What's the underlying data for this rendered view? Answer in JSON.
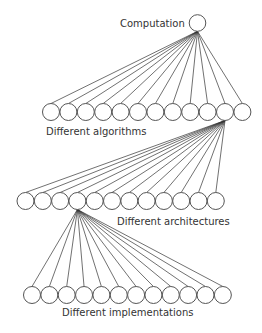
{
  "diagram": {
    "root": {
      "label": "Computation",
      "cx": 197.5,
      "cy": 23,
      "r": 8.3,
      "label_x": 120,
      "label_y": 27
    },
    "levels": [
      {
        "label": "Different algorithms",
        "label_x": 46,
        "label_y": 135,
        "node_count": 12,
        "first_cx": 51,
        "spacing": 17.4,
        "cy": 112,
        "r": 8.5,
        "parent": "root",
        "expanded_child_index": 10
      },
      {
        "label": "Different architectures",
        "label_x": 117,
        "label_y": 225,
        "node_count": 12,
        "first_cx": 25.5,
        "spacing": 17.3,
        "cy": 201,
        "r": 8.5,
        "parent_level": 0,
        "parent_index": 10,
        "expanded_child_index": 3
      },
      {
        "label": "Different implementations",
        "label_x": 62,
        "label_y": 316,
        "node_count": 12,
        "first_cx": 32,
        "spacing": 17.35,
        "cy": 295,
        "r": 8.5,
        "parent_level": 1,
        "parent_index": 3
      }
    ],
    "colors": {
      "node_stroke": "#555555",
      "edge_stroke": "#333333",
      "text": "#333333",
      "background": "#ffffff"
    }
  }
}
